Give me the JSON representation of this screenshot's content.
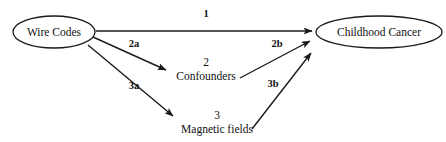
{
  "diagram": {
    "background_color": "#ffffff",
    "stroke_color": "#1a1a1a",
    "text_color": "#111111",
    "nodes": [
      {
        "id": "wire_codes",
        "label": "Wire Codes",
        "shape": "ellipse",
        "cx": 54,
        "cy": 32,
        "rx": 41,
        "ry": 16
      },
      {
        "id": "childhood_cancer",
        "label": "Childhood Cancer",
        "shape": "ellipse",
        "cx": 379,
        "cy": 32,
        "rx": 63,
        "ry": 16
      },
      {
        "id": "confounders",
        "label": "Confounders",
        "number": "2",
        "shape": "text",
        "cx": 206,
        "cy_number": 62,
        "cy_label": 76
      },
      {
        "id": "magnetic_fields",
        "label": "Magnetic fields",
        "number": "3",
        "shape": "text",
        "cx": 217,
        "cy_number": 115,
        "cy_label": 129
      }
    ],
    "edges": [
      {
        "id": "edge_1",
        "label": "1",
        "from": "wire_codes",
        "to": "childhood_cancer",
        "x1": 96,
        "y1": 31,
        "x2": 312,
        "y2": 31,
        "label_x": 206,
        "label_y": 17
      },
      {
        "id": "edge_2a",
        "label": "2a",
        "from": "wire_codes",
        "to": "confounders",
        "x1": 93,
        "y1": 37,
        "x2": 166,
        "y2": 70,
        "label_x": 134,
        "label_y": 47
      },
      {
        "id": "edge_2b",
        "label": "2b",
        "from": "confounders",
        "to": "childhood_cancer",
        "x1": 240,
        "y1": 78,
        "x2": 310,
        "y2": 41,
        "label_x": 277,
        "label_y": 47
      },
      {
        "id": "edge_3a",
        "label": "3a",
        "from": "wire_codes",
        "to": "magnetic_fields",
        "x1": 88,
        "y1": 45,
        "x2": 173,
        "y2": 116,
        "label_x": 134,
        "label_y": 89
      },
      {
        "id": "edge_3b",
        "label": "3b",
        "from": "magnetic_fields",
        "to": "childhood_cancer",
        "x1": 252,
        "y1": 129,
        "x2": 311,
        "y2": 53,
        "label_x": 273,
        "label_y": 87
      }
    ]
  }
}
